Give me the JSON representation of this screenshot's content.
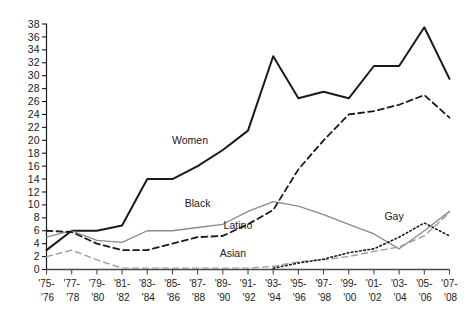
{
  "chart_data": {
    "type": "line",
    "title": "",
    "subtitle": "",
    "xlabel": "",
    "ylabel": "",
    "xlim": [
      0,
      16
    ],
    "ylim": [
      0,
      38
    ],
    "yticks": [
      0,
      2,
      4,
      6,
      8,
      10,
      12,
      14,
      16,
      18,
      20,
      22,
      24,
      26,
      28,
      30,
      32,
      34,
      36,
      38
    ],
    "grid": false,
    "legend_position": "inline-labels",
    "categories": [
      "'75-\n'76",
      "'77-\n'78",
      "'79-\n'80",
      "'81-\n'82",
      "'83-\n'84",
      "'85-\n'86",
      "'87-\n'88",
      "'89-\n'90",
      "'91-\n'92",
      "'93-\n'94",
      "'95-\n'96",
      "'97-\n'98",
      "'99-\n'00",
      "'01-\n'02",
      "'03-\n'04",
      "'05-\n'06",
      "'07-\n'08"
    ],
    "categories_top": [
      "'75-",
      "'77-",
      "'79-",
      "'81-",
      "'83-",
      "'85-",
      "'87-",
      "'89-",
      "'91-",
      "'93-",
      "'95-",
      "'97-",
      "'99-",
      "'01-",
      "'03-",
      "'05-",
      "'07-"
    ],
    "categories_bottom": [
      "'76",
      "'78",
      "'80",
      "'82",
      "'84",
      "'86",
      "'88",
      "'90",
      "'92",
      "'94",
      "'96",
      "'98",
      "'00",
      "'02",
      "'04",
      "'06",
      "'08"
    ],
    "series": [
      {
        "name": "Women",
        "style": "solid",
        "color": "#1a1a1a",
        "width": 2.0,
        "label_x": 9,
        "values": [
          3,
          6,
          6,
          6.8,
          14,
          14,
          16,
          18.5,
          21.5,
          33,
          26.5,
          27.5,
          26.5,
          31.5,
          31.5,
          37.5,
          29.5
        ]
      },
      {
        "name": "Black",
        "style": "solid",
        "color": "#8a8a8a",
        "width": 1.3,
        "label_x": 6,
        "values": [
          5,
          6,
          4.5,
          4.2,
          6,
          6,
          6.5,
          7,
          9,
          10.5,
          9.8,
          8.5,
          7,
          5.5,
          3.2,
          6,
          9
        ]
      },
      {
        "name": "Latino",
        "style": "dashed",
        "color": "#1a1a1a",
        "width": 1.8,
        "label_x": 7,
        "values": [
          6,
          5.8,
          4,
          3,
          3,
          4,
          5,
          5.2,
          7,
          9.2,
          15.5,
          20,
          24,
          24.5,
          25.5,
          27,
          23.5
        ]
      },
      {
        "name": "Asian",
        "style": "dashed",
        "color": "#9a9a9a",
        "width": 1.3,
        "label_x": 8,
        "values": [
          2,
          3,
          1.5,
          0.2,
          0.2,
          0.2,
          0.2,
          0.2,
          0.2,
          0.5,
          1.2,
          1.5,
          2,
          2.8,
          3.5,
          5.2,
          8.8
        ]
      },
      {
        "name": "Gay",
        "style": "dotted",
        "color": "#1a1a1a",
        "width": 1.6,
        "label_x": 13.6,
        "values": [
          null,
          null,
          null,
          null,
          null,
          null,
          null,
          null,
          null,
          0.2,
          1.0,
          1.6,
          2.6,
          3.2,
          5.0,
          7.2,
          5.2
        ]
      }
    ]
  }
}
